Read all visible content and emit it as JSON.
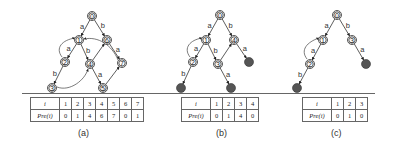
{
  "panels": [
    {
      "id": "a",
      "caption": "(a)",
      "nodes": [
        {
          "id": "0",
          "label": "0"
        },
        {
          "id": "1",
          "label": "1"
        },
        {
          "id": "2",
          "label": "2"
        },
        {
          "id": "3",
          "label": "3"
        },
        {
          "id": "4",
          "label": "4"
        },
        {
          "id": "5",
          "label": "5"
        },
        {
          "id": "6",
          "label": "6"
        },
        {
          "id": "7",
          "label": "7"
        }
      ],
      "edges": [
        {
          "from": "0",
          "to": "1",
          "label": "a"
        },
        {
          "from": "0",
          "to": "6",
          "label": "b"
        },
        {
          "from": "1",
          "to": "2",
          "label": "a"
        },
        {
          "from": "1",
          "to": "4",
          "label": "b"
        },
        {
          "from": "6",
          "to": "7",
          "label": "a"
        },
        {
          "from": "2",
          "to": "3",
          "label": "b"
        },
        {
          "from": "4",
          "to": "5",
          "label": "a"
        },
        {
          "from": "5",
          "to": "7",
          "label": ""
        },
        {
          "from": "4",
          "to": "6",
          "label": ""
        }
      ],
      "back_links": [
        {
          "from": "2",
          "to": "1"
        },
        {
          "from": "3",
          "to": "4"
        },
        {
          "from": "7",
          "to": "1"
        }
      ],
      "table": {
        "row_header_i": "i",
        "row_header_pre": "Pre(i)",
        "i": [
          "1",
          "2",
          "3",
          "4",
          "5",
          "6",
          "7"
        ],
        "pre": [
          "0",
          "1",
          "4",
          "6",
          "7",
          "0",
          "1"
        ]
      }
    },
    {
      "id": "b",
      "caption": "(b)",
      "nodes": [
        {
          "id": "0",
          "label": "0"
        },
        {
          "id": "1",
          "label": "1"
        },
        {
          "id": "2",
          "label": "2"
        },
        {
          "id": "3",
          "label": "3"
        },
        {
          "id": "4",
          "label": "4"
        }
      ],
      "terminal_count": 3,
      "edges": [
        {
          "from": "0",
          "to": "1",
          "label": "a"
        },
        {
          "from": "0",
          "to": "4",
          "label": "b"
        },
        {
          "from": "1",
          "to": "2",
          "label": "a"
        },
        {
          "from": "1",
          "to": "3",
          "label": "b"
        },
        {
          "from": "2",
          "to": "t1",
          "label": "b"
        },
        {
          "from": "3",
          "to": "t2",
          "label": "a"
        },
        {
          "from": "4",
          "to": "t3",
          "label": "a"
        },
        {
          "from": "3",
          "to": "4",
          "label": ""
        }
      ],
      "back_links": [
        {
          "from": "2",
          "to": "1"
        }
      ],
      "table": {
        "row_header_i": "i",
        "row_header_pre": "Pre(i)",
        "i": [
          "1",
          "2",
          "3",
          "4"
        ],
        "pre": [
          "0",
          "1",
          "4",
          "0"
        ]
      }
    },
    {
      "id": "c",
      "caption": "(c)",
      "nodes": [
        {
          "id": "0",
          "label": "0"
        },
        {
          "id": "1",
          "label": "1"
        },
        {
          "id": "2",
          "label": "2"
        },
        {
          "id": "3",
          "label": "3"
        }
      ],
      "terminal_count": 2,
      "edges": [
        {
          "from": "0",
          "to": "1",
          "label": "a"
        },
        {
          "from": "0",
          "to": "3",
          "label": "b"
        },
        {
          "from": "1",
          "to": "2",
          "label": "a"
        },
        {
          "from": "2",
          "to": "t1",
          "label": "b"
        },
        {
          "from": "3",
          "to": "t2",
          "label": "a"
        }
      ],
      "back_links": [
        {
          "from": "2",
          "to": "1"
        }
      ],
      "table": {
        "row_header_i": "i",
        "row_header_pre": "Pre(i)",
        "i": [
          "1",
          "2",
          "3"
        ],
        "pre": [
          "0",
          "1",
          "0"
        ]
      }
    }
  ]
}
